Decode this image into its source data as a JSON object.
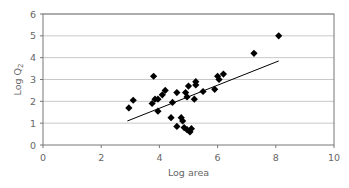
{
  "chart_data": {
    "type": "scatter",
    "title": "",
    "xlabel": "Log area",
    "ylabel": "Log Q",
    "ylabel_subscript": "2",
    "xlim": [
      0,
      10
    ],
    "ylim": [
      0,
      6
    ],
    "xticks": [
      0,
      2,
      4,
      6,
      8,
      10
    ],
    "yticks": [
      0,
      1,
      2,
      3,
      4,
      5,
      6
    ],
    "grid": "horizontal",
    "legend": "none",
    "series": [
      {
        "name": "observations",
        "marker": "diamond",
        "color": "#000000",
        "points": [
          [
            2.95,
            1.7
          ],
          [
            3.1,
            2.05
          ],
          [
            3.75,
            1.9
          ],
          [
            3.8,
            3.15
          ],
          [
            3.85,
            2.1
          ],
          [
            3.95,
            1.55
          ],
          [
            3.95,
            2.1
          ],
          [
            4.1,
            2.3
          ],
          [
            4.2,
            2.5
          ],
          [
            4.4,
            1.25
          ],
          [
            4.45,
            1.95
          ],
          [
            4.6,
            2.4
          ],
          [
            4.6,
            0.85
          ],
          [
            4.75,
            1.25
          ],
          [
            4.8,
            1.1
          ],
          [
            4.85,
            0.8
          ],
          [
            4.9,
            2.4
          ],
          [
            4.95,
            2.2
          ],
          [
            4.95,
            0.7
          ],
          [
            5.0,
            2.7
          ],
          [
            5.05,
            0.6
          ],
          [
            5.1,
            0.75
          ],
          [
            5.2,
            2.1
          ],
          [
            5.25,
            2.75
          ],
          [
            5.25,
            2.9
          ],
          [
            5.5,
            2.45
          ],
          [
            5.9,
            2.55
          ],
          [
            6.0,
            3.15
          ],
          [
            6.05,
            3.0
          ],
          [
            6.2,
            3.25
          ],
          [
            7.25,
            4.2
          ],
          [
            8.1,
            5.0
          ]
        ]
      },
      {
        "name": "trend",
        "type": "line",
        "color": "#000000",
        "points": [
          [
            2.9,
            1.1
          ],
          [
            8.1,
            3.85
          ]
        ]
      }
    ]
  }
}
